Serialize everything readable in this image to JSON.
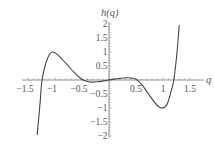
{
  "chart_data": {
    "type": "line",
    "title": "",
    "xlabel": "q",
    "ylabel": "h(q)",
    "xlim": [
      -1.5,
      1.5
    ],
    "ylim": [
      -2,
      2
    ],
    "grid": false,
    "legend": null,
    "x_ticks": [
      -1.5,
      -1,
      -0.5,
      0.5,
      1,
      1.5
    ],
    "x_tick_labels": [
      "-1.5",
      "-1",
      "-0.5",
      "0.5",
      "1",
      "1.5"
    ],
    "y_ticks": [
      2,
      1.5,
      1,
      0.5,
      -0.5,
      -1,
      -1.5,
      -2
    ],
    "y_tick_labels": [
      "2",
      "1.5",
      "1",
      "0.5",
      "-0.5",
      "-1",
      "-1.5",
      "-2"
    ],
    "series": [
      {
        "name": "h(q)",
        "x": [
          -1.33,
          -1.28,
          -1.24,
          -1.17,
          -1.1,
          -1.04,
          -0.95,
          -0.8,
          -0.65,
          -0.5,
          -0.35,
          -0.2,
          0,
          0.2,
          0.35,
          0.5,
          0.6,
          0.75,
          0.9,
          1.0,
          1.08,
          1.15,
          1.2,
          1.26,
          1.3
        ],
        "y": [
          -1.96,
          -0.9,
          0,
          0.6,
          0.92,
          1.0,
          0.9,
          0.6,
          0.28,
          0.02,
          -0.07,
          -0.06,
          0,
          0.06,
          0.08,
          0.03,
          -0.15,
          -0.55,
          -0.92,
          -1.0,
          -0.85,
          -0.4,
          0,
          1.0,
          1.96
        ]
      }
    ]
  },
  "axes": {
    "x_label": "q",
    "y_label": "h(q)"
  }
}
